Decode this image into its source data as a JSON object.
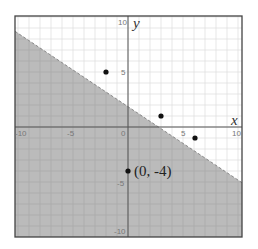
{
  "chart_data": {
    "type": "scatter",
    "title": "",
    "xlabel": "x",
    "ylabel": "y",
    "xlim": [
      -10.3,
      10.3
    ],
    "ylim": [
      -10,
      10
    ],
    "grid": true,
    "x_ticks": [
      "-10",
      "-5",
      "0",
      "5",
      "10"
    ],
    "y_ticks": [
      "10",
      "5",
      "-5",
      "-10"
    ],
    "boundary_line": {
      "equation": "y = -2/3 x + 2",
      "slope": -0.6667,
      "intercept": 2,
      "style": "dashed",
      "shaded_region": "below"
    },
    "points": [
      {
        "x": -2,
        "y": 5
      },
      {
        "x": 3,
        "y": 1
      },
      {
        "x": 6,
        "y": -1
      },
      {
        "x": 0,
        "y": -4
      }
    ],
    "annotations": [
      {
        "text": "(0, -4)",
        "x": 0,
        "y": -4
      }
    ]
  },
  "labels": {
    "x_axis": "x",
    "y_axis": "y",
    "xt_m10": "-10",
    "xt_m5": "-5",
    "xt_0": "0",
    "xt_5": "5",
    "xt_10": "10",
    "yt_10": "10",
    "yt_5": "5",
    "yt_m5": "-5",
    "yt_m10": "-10",
    "point_annotation": "(0, -4)"
  },
  "colors": {
    "shade": "#b5b5b5",
    "grid_light": "#e2e2e2",
    "axis": "#555555",
    "point": "#111111"
  }
}
